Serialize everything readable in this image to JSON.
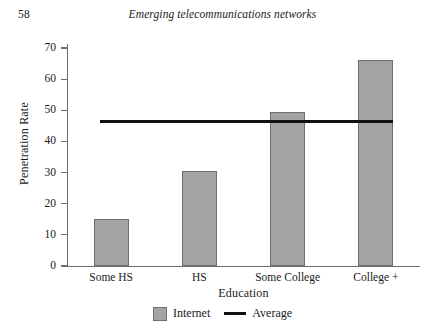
{
  "page": {
    "number": "58",
    "running_head": "Emerging telecommunications networks"
  },
  "legend": {
    "bar_label": "Internet",
    "line_label": "Average"
  },
  "colors": {
    "bar_fill": "#a3a3a3",
    "bar_stroke": "#6f6f6f",
    "line": "#111111",
    "axis": "#6d6d6d"
  },
  "chart_data": {
    "type": "bar",
    "title": "",
    "xlabel": "Education",
    "ylabel": "Penetration Rate",
    "categories": [
      "Some HS",
      "HS",
      "Some College",
      "College +"
    ],
    "series": [
      {
        "name": "Internet",
        "type": "bar",
        "values": [
          15,
          30.5,
          49.5,
          66
        ]
      },
      {
        "name": "Average",
        "type": "line",
        "value": 46.5,
        "values": [
          46.5,
          46.5,
          46.5,
          46.5
        ]
      }
    ],
    "ylim": [
      0,
      70
    ],
    "yticks": [
      0,
      10,
      20,
      30,
      40,
      50,
      60,
      70
    ],
    "ytick_labels": [
      "0",
      "10",
      "20",
      "30",
      "40",
      "50",
      "60",
      "70"
    ],
    "grid": false,
    "legend_position": "bottom"
  }
}
